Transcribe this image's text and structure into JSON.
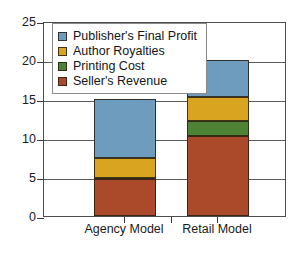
{
  "chart_data": {
    "type": "bar",
    "subtype": "stacked-vertical",
    "title": "",
    "xlabel": "",
    "ylabel": "",
    "categories": [
      "Agency Model",
      "Retail Model"
    ],
    "ylim": [
      0,
      25
    ],
    "yticks": [
      0,
      5,
      10,
      15,
      20,
      25
    ],
    "ytick_labels": [
      "0",
      "5",
      "10",
      "15",
      "20",
      "25"
    ],
    "grid": true,
    "legend_position": "upper left inside plot",
    "stack_order_bottom_to_top": [
      "Seller's Revenue",
      "Printing Cost",
      "Author Royalties",
      "Publisher's Final Profit"
    ],
    "series": [
      {
        "name": "Publisher's Final Profit",
        "color": "#6d9cbe",
        "values": [
          7.6,
          4.7
        ]
      },
      {
        "name": "Author Royalties",
        "color": "#d9a520",
        "values": [
          2.5,
          3.1
        ]
      },
      {
        "name": "Printing Cost",
        "color": "#4e8234",
        "values": [
          0.2,
          1.9
        ]
      },
      {
        "name": "Seller's Revenue",
        "color": "#ab4a2a",
        "values": [
          4.7,
          10.3
        ]
      }
    ],
    "totals": [
      15.0,
      20.0
    ],
    "annotations": []
  },
  "legend": {
    "entries": [
      {
        "label": "Publisher's Final Profit",
        "color": "#6d9cbe"
      },
      {
        "label": "Author Royalties",
        "color": "#d9a520"
      },
      {
        "label": "Printing Cost",
        "color": "#4e8234"
      },
      {
        "label": "Seller's Revenue",
        "color": "#ab4a2a"
      }
    ]
  },
  "axes": {
    "y_tick_labels": [
      "25",
      "20",
      "15",
      "10",
      "5",
      "0"
    ],
    "x_tick_labels": [
      "Agency Model",
      "Retail Model"
    ]
  },
  "colors": {
    "axis": "#4d4d4d",
    "gridline": "#5a5a5a",
    "text": "#1a1a1a",
    "background": "#ffffff",
    "legend_border": "#8a8a8a"
  }
}
